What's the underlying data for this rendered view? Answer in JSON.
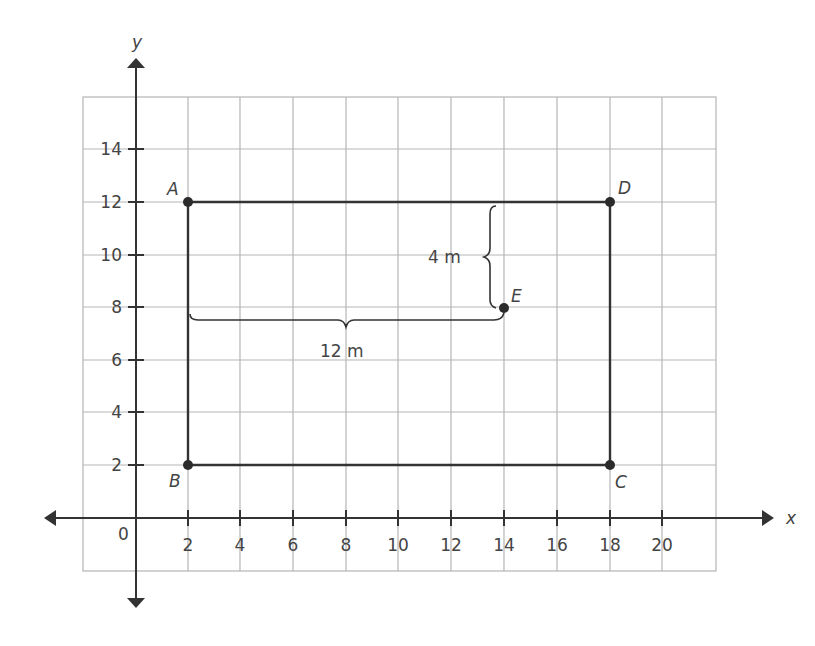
{
  "diagram": {
    "axes": {
      "x_label": "x",
      "y_label": "y",
      "origin_label": "0",
      "x_ticks": [
        "2",
        "4",
        "6",
        "8",
        "10",
        "12",
        "14",
        "16",
        "18",
        "20"
      ],
      "y_ticks": [
        "2",
        "4",
        "6",
        "8",
        "10",
        "12",
        "14"
      ]
    },
    "points": [
      {
        "name": "A",
        "x": 2,
        "y": 12
      },
      {
        "name": "B",
        "x": 2,
        "y": 2
      },
      {
        "name": "C",
        "x": 18,
        "y": 2
      },
      {
        "name": "D",
        "x": 18,
        "y": 12
      },
      {
        "name": "E",
        "x": 14,
        "y": 8
      }
    ],
    "rectangle": [
      "A",
      "D",
      "C",
      "B"
    ],
    "dimensions": {
      "vertical": {
        "label": "4 m",
        "from_y": 12,
        "to_y": 8,
        "at_x": 14
      },
      "horizontal": {
        "label": "12 m",
        "from_x": 2,
        "to_x": 14,
        "at_y": 8
      }
    },
    "colors": {
      "grid": "#b5b5b5",
      "line": "#333333",
      "axis": "#333333",
      "text": "#444444"
    }
  }
}
